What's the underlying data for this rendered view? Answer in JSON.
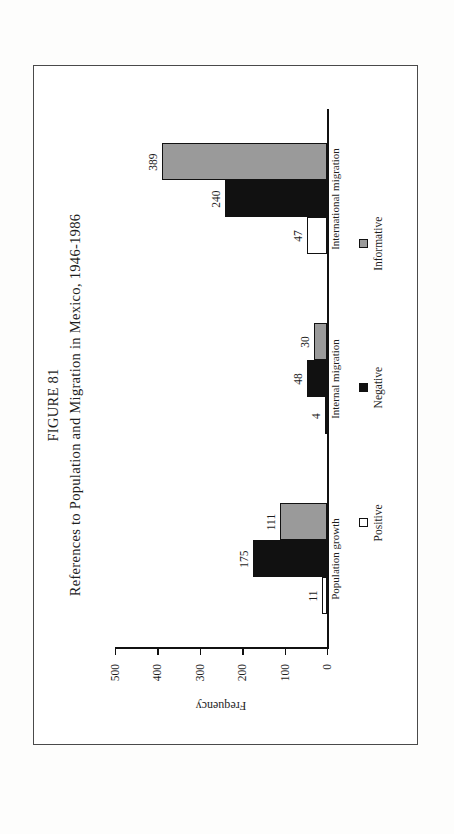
{
  "page": {
    "background_color": "#fdfdfc",
    "frame_color": "#4a4a4a"
  },
  "figure": {
    "number": "FIGURE 81",
    "caption": "References to Population and Migration in Mexico, 1946-1986"
  },
  "colors": {
    "positive": "#ffffff",
    "negative": "#111111",
    "informative": "#9a9a9a",
    "axis": "#111111",
    "text": "#1d1d1d"
  },
  "legend": {
    "items": [
      {
        "label": "Positive",
        "key": "positive"
      },
      {
        "label": "Negative",
        "key": "negative"
      },
      {
        "label": "Informative",
        "key": "informative"
      }
    ]
  },
  "chart_data": {
    "type": "bar",
    "title": "References to Population and Migration in Mexico, 1946-1986",
    "subtitle": "FIGURE 81",
    "xlabel": "",
    "ylabel": "Frequency",
    "ylim": [
      0,
      500
    ],
    "yticks": [
      0,
      100,
      200,
      300,
      400,
      500
    ],
    "ytick_labels": [
      "0",
      "100",
      "200",
      "300",
      "400",
      "500"
    ],
    "grid": false,
    "legend_position": "bottom",
    "orientation": "vertical",
    "page_rotation_degrees": -90,
    "categories": [
      "Population growth",
      "Internal migration",
      "International migration"
    ],
    "series": [
      {
        "name": "Positive",
        "values": [
          11,
          4,
          47
        ]
      },
      {
        "name": "Negative",
        "values": [
          175,
          48,
          240
        ]
      },
      {
        "name": "Informative",
        "values": [
          111,
          30,
          389
        ]
      }
    ]
  }
}
